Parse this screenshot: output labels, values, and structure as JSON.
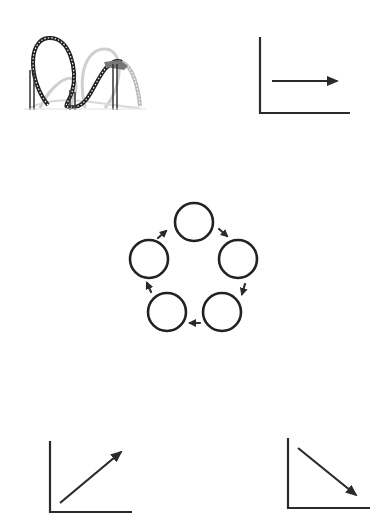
{
  "colors": {
    "ink": "#2a2a2a",
    "background": "#ffffff",
    "track_light": "#c8c8c8"
  },
  "panels": {
    "top_left": {
      "name": "roller-coaster-illustration"
    },
    "top_right": {
      "name": "flat-trend-graph",
      "trend": "flat"
    },
    "center": {
      "name": "cycle-diagram",
      "node_count": 5
    },
    "bottom_left": {
      "name": "rising-trend-graph",
      "trend": "up"
    },
    "bottom_right": {
      "name": "falling-trend-graph",
      "trend": "down"
    }
  }
}
